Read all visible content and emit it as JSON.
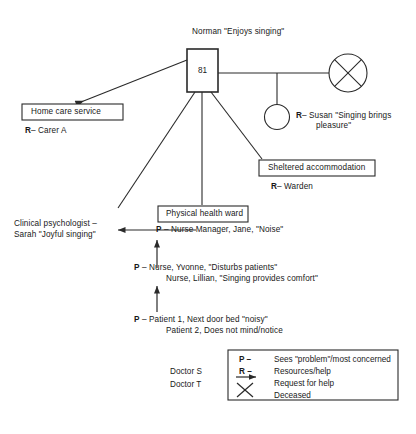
{
  "diagram": {
    "title_person": "Norman \"Enjoys singing\"",
    "ego_age": "81"
  },
  "nodes": {
    "home_care": {
      "box_label": "Home care service",
      "sub_code": "R",
      "sub_dash": "–",
      "sub_text": "Carer A"
    },
    "sheltered": {
      "box_label": "Sheltered accommodation",
      "sub_code": "R",
      "sub_dash": "–",
      "sub_text": "Warden"
    },
    "physical_ward": {
      "box_label": "Physical health ward"
    },
    "susan": {
      "code": "R",
      "dash": "–",
      "line1": "Susan \"Singing brings",
      "line2": "pleasure\""
    },
    "psychologist": {
      "line1": "Clinical psychologist –",
      "line2": "Sarah \"Joyful singing\""
    },
    "nurse_manager": {
      "code": "P",
      "dash": "–",
      "text": "Nurse Manager, Jane, \"Noise\""
    },
    "nurses": {
      "code": "P",
      "dash": "–",
      "line1": "Nurse, Yvonne, \"Disturbs patients\"",
      "line2": "Nurse, Lillian, \"Singing provides comfort\""
    },
    "patients": {
      "code": "P",
      "dash": "–",
      "line1": "Patient 1, Next door bed \"noisy\"",
      "line2": "Patient 2, Does not mind/notice"
    },
    "deceased_spouse": {
      "icon": "crossed-circle-deceased"
    }
  },
  "doctors": {
    "line1": "Doctor S",
    "line2": "Doctor T"
  },
  "legend": {
    "rows": [
      {
        "symbol": "P –",
        "symbol_kind": "text",
        "desc": "Sees \"problem\"/most concerned"
      },
      {
        "symbol": "R –",
        "symbol_kind": "text",
        "desc": "Resources/help"
      },
      {
        "symbol": "",
        "symbol_kind": "arrow",
        "desc": "Request for help"
      },
      {
        "symbol": "",
        "symbol_kind": "cross",
        "desc": "Deceased"
      }
    ]
  },
  "colors": {
    "stroke": "#2a2a2a",
    "text": "#181818",
    "background": "#ffffff"
  }
}
